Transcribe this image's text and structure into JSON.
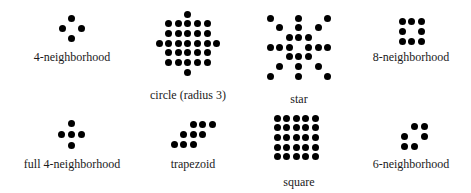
{
  "colors": {
    "dot": "#000000",
    "text": "#1a1a1a",
    "background": "#ffffff"
  },
  "shapes": [
    {
      "id": "four-neighborhood",
      "label": "4-neighborhood",
      "origin": [
        62,
        18
      ],
      "spacing": [
        9.7,
        10.3
      ],
      "dots": [
        [
          1,
          0
        ],
        [
          0,
          1
        ],
        [
          2,
          1
        ],
        [
          1,
          2
        ]
      ],
      "label_pos": [
        72,
        50
      ]
    },
    {
      "id": "circle-radius-3",
      "label": "circle (radius 3)",
      "origin": [
        159,
        14
      ],
      "spacing": [
        9.6,
        9.7
      ],
      "dots": [
        [
          3,
          0
        ],
        [
          1,
          1
        ],
        [
          2,
          1
        ],
        [
          3,
          1
        ],
        [
          4,
          1
        ],
        [
          5,
          1
        ],
        [
          1,
          2
        ],
        [
          2,
          2
        ],
        [
          3,
          2
        ],
        [
          4,
          2
        ],
        [
          5,
          2
        ],
        [
          0,
          3
        ],
        [
          1,
          3
        ],
        [
          2,
          3
        ],
        [
          3,
          3
        ],
        [
          4,
          3
        ],
        [
          5,
          3
        ],
        [
          6,
          3
        ],
        [
          1,
          4
        ],
        [
          2,
          4
        ],
        [
          3,
          4
        ],
        [
          4,
          4
        ],
        [
          5,
          4
        ],
        [
          1,
          5
        ],
        [
          2,
          5
        ],
        [
          3,
          5
        ],
        [
          4,
          5
        ],
        [
          5,
          5
        ],
        [
          3,
          6
        ]
      ],
      "label_pos": [
        188,
        88
      ]
    },
    {
      "id": "star",
      "label": "star",
      "origin": [
        270,
        18
      ],
      "spacing": [
        9.6,
        9.7
      ],
      "dots": [
        [
          0,
          0
        ],
        [
          3,
          0
        ],
        [
          6,
          0
        ],
        [
          1,
          1
        ],
        [
          3,
          1
        ],
        [
          5,
          1
        ],
        [
          2,
          2
        ],
        [
          3,
          2
        ],
        [
          4,
          2
        ],
        [
          0,
          3
        ],
        [
          1,
          3
        ],
        [
          2,
          3
        ],
        [
          4,
          3
        ],
        [
          5,
          3
        ],
        [
          6,
          3
        ],
        [
          2,
          4
        ],
        [
          3,
          4
        ],
        [
          4,
          4
        ],
        [
          1,
          5
        ],
        [
          3,
          5
        ],
        [
          5,
          5
        ],
        [
          0,
          6
        ],
        [
          3,
          6
        ],
        [
          6,
          6
        ]
      ],
      "label_pos": [
        299,
        92
      ]
    },
    {
      "id": "eight-neighborhood",
      "label": "8-neighborhood",
      "origin": [
        402,
        21
      ],
      "spacing": [
        9.6,
        10
      ],
      "dots": [
        [
          0,
          0
        ],
        [
          1,
          0
        ],
        [
          2,
          0
        ],
        [
          0,
          1
        ],
        [
          2,
          1
        ],
        [
          0,
          2
        ],
        [
          1,
          2
        ],
        [
          2,
          2
        ]
      ],
      "label_pos": [
        411,
        50
      ]
    },
    {
      "id": "full-four-neighborhood",
      "label": "full 4-neighborhood",
      "origin": [
        61,
        123
      ],
      "spacing": [
        10,
        11
      ],
      "dots": [
        [
          1,
          0
        ],
        [
          0,
          1
        ],
        [
          1,
          1
        ],
        [
          2,
          1
        ],
        [
          1,
          2
        ]
      ],
      "label_pos": [
        72,
        157
      ]
    },
    {
      "id": "trapezoid",
      "label": "trapezoid",
      "origin": [
        174,
        124
      ],
      "spacing": [
        9.6,
        10
      ],
      "dots": [
        [
          2,
          0
        ],
        [
          3,
          0
        ],
        [
          4,
          0
        ],
        [
          1,
          1
        ],
        [
          2,
          1
        ],
        [
          3,
          1
        ],
        [
          0,
          2
        ],
        [
          1,
          2
        ],
        [
          2,
          2
        ]
      ],
      "label_pos": [
        193,
        157
      ]
    },
    {
      "id": "square",
      "label": "square",
      "origin": [
        277,
        118
      ],
      "spacing": [
        9.6,
        9.7
      ],
      "dots": [
        [
          0,
          0
        ],
        [
          1,
          0
        ],
        [
          2,
          0
        ],
        [
          3,
          0
        ],
        [
          4,
          0
        ],
        [
          0,
          1
        ],
        [
          1,
          1
        ],
        [
          2,
          1
        ],
        [
          3,
          1
        ],
        [
          4,
          1
        ],
        [
          0,
          2
        ],
        [
          1,
          2
        ],
        [
          2,
          2
        ],
        [
          3,
          2
        ],
        [
          4,
          2
        ],
        [
          0,
          3
        ],
        [
          1,
          3
        ],
        [
          2,
          3
        ],
        [
          3,
          3
        ],
        [
          4,
          3
        ],
        [
          0,
          4
        ],
        [
          1,
          4
        ],
        [
          2,
          4
        ],
        [
          3,
          4
        ],
        [
          4,
          4
        ]
      ],
      "label_pos": [
        299,
        175
      ]
    },
    {
      "id": "six-neighborhood",
      "label": "6-neighborhood",
      "origin": [
        404,
        126
      ],
      "spacing": [
        10,
        10
      ],
      "dots": [
        [
          1,
          0
        ],
        [
          2,
          0
        ],
        [
          0,
          1
        ],
        [
          2,
          1
        ],
        [
          0,
          2
        ],
        [
          1,
          2
        ]
      ],
      "label_pos": [
        411,
        157
      ]
    }
  ]
}
